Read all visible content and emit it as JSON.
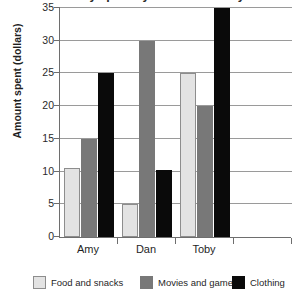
{
  "chart_data": {
    "type": "bar",
    "title": "Money spent by students in July",
    "xlabel": "",
    "ylabel": "Amount spent (dollars)",
    "categories": [
      "Amy",
      "Dan",
      "Toby"
    ],
    "series": [
      {
        "name": "Food and snacks",
        "color": "#e3e3e3",
        "values": [
          10.5,
          5,
          25
        ]
      },
      {
        "name": "Movies and games",
        "color": "#787878",
        "values": [
          15,
          30,
          20
        ]
      },
      {
        "name": "Clothing",
        "color": "#0a0a0a",
        "values": [
          25,
          10.3,
          35
        ]
      }
    ],
    "ylim": [
      0,
      35
    ],
    "yticks": [
      0,
      5,
      10,
      15,
      20,
      25,
      30,
      35
    ],
    "ytick_labels": [
      "0",
      "5",
      "10",
      "15",
      "20",
      "25",
      "30",
      "35"
    ],
    "grid": true,
    "legend_position": "bottom",
    "empty_trailing_slot": true
  },
  "legend": {
    "items": [
      {
        "label": "Food and snacks"
      },
      {
        "label": "Movies and games"
      },
      {
        "label": "Clothing"
      }
    ]
  }
}
